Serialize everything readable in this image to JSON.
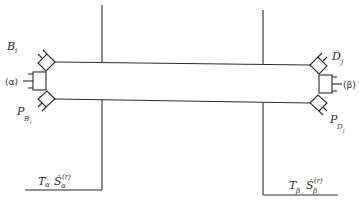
{
  "diagram": {
    "type": "two-reservoir-pipe-system",
    "labels": {
      "left_top": {
        "main": "B",
        "sub": "i"
      },
      "left_mid": "(α)",
      "left_bottom": {
        "main": "P",
        "sub": "B",
        "subsub": "i"
      },
      "right_top": {
        "main": "D",
        "sub": "j"
      },
      "right_mid": "(β)",
      "right_bottom": {
        "main": "P",
        "sub": "D",
        "subsub": "j"
      },
      "left_reservoir": {
        "T": "T",
        "T_sub": "α",
        "S": "Ṡ",
        "S_sub": "α",
        "S_sup": "(r)"
      },
      "right_reservoir": {
        "T": "T",
        "T_sub": "β",
        "S": "Ṡ",
        "S_sub": "β",
        "S_sup": "(r)"
      }
    },
    "colors": {
      "line": "#2a2a2a",
      "background": "#ffffff"
    }
  }
}
